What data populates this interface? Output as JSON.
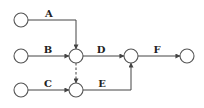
{
  "diagram": {
    "type": "activity-on-arrow network",
    "colors": {
      "line": "#444444",
      "node_stroke": "#555555",
      "label": "#222222",
      "background": "#ffffff"
    },
    "nodes": [
      {
        "id": "n1",
        "cx": 21,
        "cy": 20
      },
      {
        "id": "n2",
        "cx": 21,
        "cy": 56
      },
      {
        "id": "n3",
        "cx": 21,
        "cy": 90
      },
      {
        "id": "n4",
        "cx": 76,
        "cy": 56
      },
      {
        "id": "n5",
        "cx": 76,
        "cy": 90
      },
      {
        "id": "n6",
        "cx": 131,
        "cy": 56
      },
      {
        "id": "n7",
        "cx": 187,
        "cy": 56
      }
    ],
    "edges": [
      {
        "label": "A",
        "from": "n1",
        "to": "n4",
        "style": "solid"
      },
      {
        "label": "B",
        "from": "n2",
        "to": "n4",
        "style": "solid"
      },
      {
        "label": "C",
        "from": "n3",
        "to": "n5",
        "style": "solid"
      },
      {
        "label": "D",
        "from": "n4",
        "to": "n6",
        "style": "solid"
      },
      {
        "label": "E",
        "from": "n5",
        "to": "n6",
        "style": "solid"
      },
      {
        "label": "F",
        "from": "n6",
        "to": "n7",
        "style": "solid"
      },
      {
        "label": "",
        "from": "n4",
        "to": "n5",
        "style": "dashed",
        "note": "dummy activity"
      }
    ],
    "labels": {
      "A": "A",
      "B": "B",
      "C": "C",
      "D": "D",
      "E": "E",
      "F": "F"
    }
  }
}
